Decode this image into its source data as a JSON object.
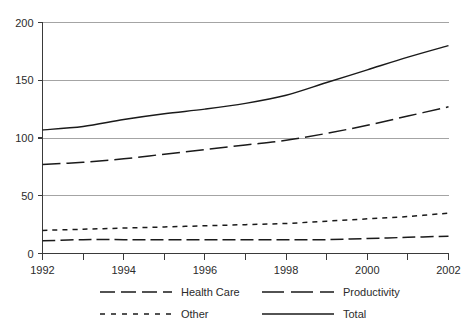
{
  "chart_data": {
    "type": "line",
    "title": "",
    "subtitle": "",
    "xlabel": "",
    "ylabel": "",
    "x": [
      1992,
      1993,
      1994,
      1995,
      1996,
      1997,
      1998,
      1999,
      2000,
      2001,
      2002
    ],
    "xlim": [
      1992,
      2002
    ],
    "ylim": [
      0,
      200
    ],
    "xticks": [
      1992,
      1993,
      1994,
      1995,
      1996,
      1997,
      1998,
      1999,
      2000,
      2001,
      2002
    ],
    "xtick_labels": [
      "1992",
      "",
      "1994",
      "",
      "1996",
      "",
      "1998",
      "",
      "2000",
      "",
      "2002"
    ],
    "yticks": [
      0,
      50,
      100,
      150,
      200
    ],
    "ytick_labels": [
      "0",
      "50",
      "100",
      "150",
      "200"
    ],
    "grid": "horizontal",
    "legend_position": "bottom",
    "series": [
      {
        "name": "Health Care",
        "dash": "medium",
        "values": [
          11,
          12,
          12,
          12,
          12,
          12,
          12,
          12,
          13,
          14,
          15
        ]
      },
      {
        "name": "Productivity",
        "dash": "long",
        "values": [
          77,
          79,
          82,
          86,
          90,
          94,
          98,
          104,
          111,
          119,
          127
        ]
      },
      {
        "name": "Other",
        "dash": "short",
        "values": [
          20,
          21,
          22,
          23,
          24,
          25,
          26,
          28,
          30,
          32,
          35
        ]
      },
      {
        "name": "Total",
        "dash": "solid",
        "values": [
          107,
          110,
          116,
          121,
          125,
          130,
          137,
          148,
          159,
          170,
          180
        ]
      }
    ]
  },
  "legend": {
    "entries": [
      {
        "label": "Health Care",
        "style": "medium-dash"
      },
      {
        "label": "Productivity",
        "style": "long-dash"
      },
      {
        "label": "Other",
        "style": "short-dash"
      },
      {
        "label": "Total",
        "style": "solid"
      }
    ]
  },
  "colors": {
    "line": "#1a1a1a",
    "grid": "#9a9a9a",
    "axis": "#3a3a3a",
    "text": "#2b2b2b",
    "background": "#ffffff"
  }
}
